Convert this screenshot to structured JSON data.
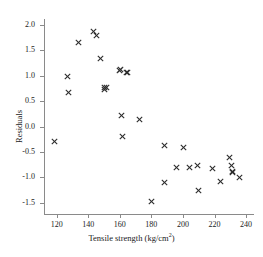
{
  "chart_data": {
    "type": "scatter",
    "title": "",
    "xlabel": "Tensile strength (kg/cm²)",
    "ylabel": "Residuals",
    "xlim": [
      112,
      245
    ],
    "ylim": [
      -1.72,
      2.12
    ],
    "xticks": [
      120,
      140,
      160,
      180,
      200,
      220,
      240
    ],
    "yticks": [
      -1.5,
      -1.0,
      -0.5,
      0.0,
      0.5,
      1.0,
      1.5,
      2.0
    ],
    "xtick_labels": [
      "120",
      "140",
      "160",
      "180",
      "200",
      "220",
      "240"
    ],
    "ytick_labels": [
      "-1.5",
      "-1.0",
      "-0.5",
      "0.0",
      "0.5",
      "1.0",
      "1.5",
      "2.0"
    ],
    "grid": false,
    "legend": null,
    "marker": "x",
    "marker_color": "#2b2b2b",
    "x": [
      118.5,
      127.0,
      127.5,
      134.0,
      143.5,
      145.5,
      147.5,
      150.5,
      150.5,
      151.5,
      160.0,
      160.5,
      161.0,
      161.5,
      164.0,
      165.0,
      172.5,
      180.0,
      188.0,
      188.5,
      196.0,
      200.5,
      204.0,
      209.5,
      210.0,
      219.0,
      224.0,
      229.5,
      231.0,
      231.5,
      231.5,
      236.0
    ],
    "y": [
      -0.3,
      0.98,
      0.67,
      1.65,
      1.88,
      1.79,
      1.34,
      0.78,
      0.73,
      0.78,
      1.11,
      1.13,
      0.22,
      -0.19,
      1.06,
      1.06,
      0.14,
      -1.48,
      -0.38,
      -1.1,
      -0.8,
      -0.42,
      -0.81,
      -0.77,
      -1.26,
      -0.82,
      -1.08,
      -0.6,
      -0.76,
      -0.88,
      -0.91,
      -1.01
    ],
    "points": [
      {
        "x": 118.5,
        "y": -0.3
      },
      {
        "x": 127.0,
        "y": 0.98
      },
      {
        "x": 127.5,
        "y": 0.67
      },
      {
        "x": 134.0,
        "y": 1.65
      },
      {
        "x": 143.5,
        "y": 1.88
      },
      {
        "x": 145.5,
        "y": 1.79
      },
      {
        "x": 147.5,
        "y": 1.34
      },
      {
        "x": 150.5,
        "y": 0.78
      },
      {
        "x": 150.5,
        "y": 0.73
      },
      {
        "x": 151.5,
        "y": 0.78
      },
      {
        "x": 160.0,
        "y": 1.11
      },
      {
        "x": 160.5,
        "y": 1.13
      },
      {
        "x": 161.0,
        "y": 0.22
      },
      {
        "x": 161.5,
        "y": -0.19
      },
      {
        "x": 164.0,
        "y": 1.06
      },
      {
        "x": 165.0,
        "y": 1.06
      },
      {
        "x": 172.5,
        "y": 0.14
      },
      {
        "x": 180.0,
        "y": -1.48
      },
      {
        "x": 188.0,
        "y": -0.38
      },
      {
        "x": 188.5,
        "y": -1.1
      },
      {
        "x": 196.0,
        "y": -0.8
      },
      {
        "x": 200.5,
        "y": -0.42
      },
      {
        "x": 204.0,
        "y": -0.81
      },
      {
        "x": 209.5,
        "y": -0.77
      },
      {
        "x": 210.0,
        "y": -1.26
      },
      {
        "x": 219.0,
        "y": -0.82
      },
      {
        "x": 224.0,
        "y": -1.08
      },
      {
        "x": 229.5,
        "y": -0.6
      },
      {
        "x": 231.0,
        "y": -0.76
      },
      {
        "x": 231.5,
        "y": -0.88
      },
      {
        "x": 231.5,
        "y": -0.91
      },
      {
        "x": 236.0,
        "y": -1.01
      }
    ]
  }
}
